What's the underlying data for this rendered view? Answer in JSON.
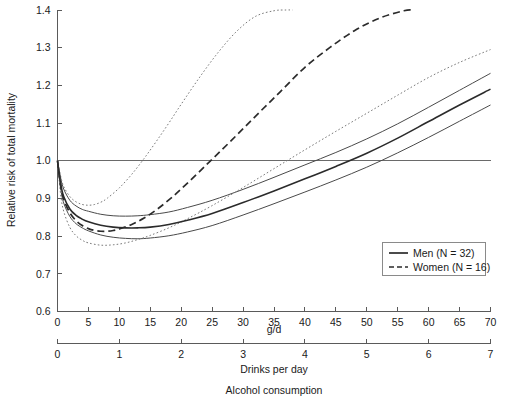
{
  "chart_data": {
    "type": "line",
    "title": "",
    "subtitle": "",
    "ylabel": "Relative risk of total mortality",
    "xlabel": "Alcohol consumption",
    "xlabel_primary": "g/d",
    "xlabel_secondary": "Drinks per day",
    "ylim": [
      0.6,
      1.4
    ],
    "xlim": [
      0,
      70
    ],
    "xlim_secondary": [
      0,
      7
    ],
    "yticks": [
      "0.6",
      "0.7",
      "0.8",
      "0.9",
      "1.0",
      "1.1",
      "1.2",
      "1.3",
      "1.4"
    ],
    "ytick_values": [
      0.6,
      0.7,
      0.8,
      0.9,
      1.0,
      1.1,
      1.2,
      1.3,
      1.4
    ],
    "xticks": [
      "0",
      "5",
      "10",
      "15",
      "20",
      "25",
      "30",
      "35",
      "40",
      "45",
      "50",
      "55",
      "60",
      "65",
      "70"
    ],
    "xtick_values": [
      0,
      5,
      10,
      15,
      20,
      25,
      30,
      35,
      40,
      45,
      50,
      55,
      60,
      65,
      70
    ],
    "xticks_secondary": [
      "0",
      "1",
      "2",
      "3",
      "4",
      "5",
      "6",
      "7"
    ],
    "xtick_values_secondary": [
      0,
      1,
      2,
      3,
      4,
      5,
      6,
      7
    ],
    "grid": false,
    "reference_line_y": 1.0,
    "legend_position": "lower-right",
    "legend": [
      {
        "label": "Men (N = 32)",
        "style": "solid"
      },
      {
        "label": "Women (N = 16)",
        "style": "dashed"
      }
    ],
    "series": [
      {
        "name": "Men (N = 32)",
        "style": "solid",
        "role": "central",
        "x": [
          0,
          0.5,
          1,
          2,
          3,
          4,
          5,
          7,
          9,
          11,
          13,
          15,
          18,
          21,
          25,
          30,
          35,
          40,
          45,
          50,
          55,
          60,
          65,
          70
        ],
        "values": [
          1.0,
          0.94,
          0.905,
          0.872,
          0.855,
          0.845,
          0.838,
          0.829,
          0.824,
          0.822,
          0.822,
          0.824,
          0.831,
          0.842,
          0.86,
          0.889,
          0.92,
          0.952,
          0.985,
          1.02,
          1.06,
          1.104,
          1.148,
          1.19
        ]
      },
      {
        "name": "Men upper 95% CI",
        "style": "solid-thin",
        "role": "ci-upper",
        "x": [
          0,
          0.5,
          1,
          2,
          3,
          4,
          5,
          7,
          9,
          11,
          13,
          15,
          18,
          21,
          25,
          30,
          35,
          40,
          45,
          50,
          55,
          60,
          65,
          70
        ],
        "values": [
          1.0,
          0.955,
          0.925,
          0.895,
          0.88,
          0.871,
          0.866,
          0.858,
          0.854,
          0.853,
          0.854,
          0.857,
          0.864,
          0.876,
          0.895,
          0.924,
          0.956,
          0.989,
          1.022,
          1.058,
          1.098,
          1.142,
          1.187,
          1.232
        ]
      },
      {
        "name": "Men lower 95% CI",
        "style": "solid-thin",
        "role": "ci-lower",
        "x": [
          0,
          0.5,
          1,
          2,
          3,
          4,
          5,
          7,
          9,
          11,
          13,
          15,
          18,
          21,
          25,
          30,
          35,
          40,
          45,
          50,
          55,
          60,
          65,
          70
        ],
        "values": [
          1.0,
          0.928,
          0.888,
          0.852,
          0.833,
          0.822,
          0.814,
          0.803,
          0.797,
          0.794,
          0.793,
          0.795,
          0.801,
          0.811,
          0.828,
          0.856,
          0.886,
          0.917,
          0.949,
          0.983,
          1.021,
          1.062,
          1.105,
          1.148
        ]
      },
      {
        "name": "Women (N = 16)",
        "style": "dashed",
        "role": "central",
        "x": [
          0,
          0.5,
          1,
          2,
          3,
          4,
          5,
          6,
          7,
          8,
          9,
          10,
          12,
          14,
          16,
          18,
          20,
          24,
          28,
          32,
          36,
          40,
          44,
          48,
          52,
          56,
          57.5
        ],
        "values": [
          1.0,
          0.935,
          0.898,
          0.862,
          0.841,
          0.828,
          0.82,
          0.815,
          0.813,
          0.813,
          0.815,
          0.819,
          0.831,
          0.848,
          0.87,
          0.896,
          0.925,
          0.988,
          1.052,
          1.118,
          1.183,
          1.248,
          1.3,
          1.345,
          1.378,
          1.398,
          1.4
        ]
      },
      {
        "name": "Women upper 95% CI",
        "style": "dotted",
        "role": "ci-upper",
        "x": [
          0,
          0.5,
          1,
          2,
          3,
          4,
          5,
          6,
          7,
          8,
          10,
          12,
          14,
          16,
          18,
          20,
          23,
          26,
          29,
          32,
          35,
          37,
          38
        ],
        "values": [
          1.0,
          0.96,
          0.932,
          0.905,
          0.891,
          0.884,
          0.882,
          0.884,
          0.89,
          0.9,
          0.928,
          0.964,
          1.006,
          1.052,
          1.1,
          1.15,
          1.222,
          1.288,
          1.344,
          1.383,
          1.398,
          1.4,
          1.4
        ]
      },
      {
        "name": "Women lower 95% CI",
        "style": "dotted",
        "role": "ci-lower",
        "x": [
          0,
          0.5,
          1,
          2,
          3,
          4,
          5,
          7,
          9,
          11,
          13,
          15,
          18,
          21,
          25,
          30,
          35,
          40,
          45,
          50,
          55,
          60,
          65,
          70
        ],
        "values": [
          1.0,
          0.912,
          0.866,
          0.823,
          0.801,
          0.789,
          0.782,
          0.776,
          0.777,
          0.782,
          0.791,
          0.802,
          0.822,
          0.846,
          0.881,
          0.929,
          0.979,
          1.029,
          1.078,
          1.126,
          1.174,
          1.221,
          1.261,
          1.295
        ]
      }
    ]
  }
}
